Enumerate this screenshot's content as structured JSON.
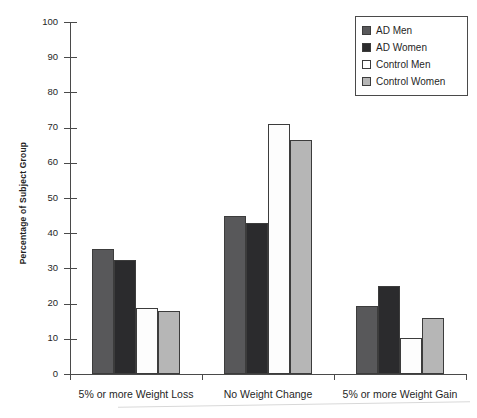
{
  "chart_data": {
    "type": "bar",
    "title": "",
    "xlabel": "",
    "ylabel": "Percentage of Subject Group",
    "ylim": [
      0,
      100
    ],
    "ytick_step": 10,
    "yticks": [
      0,
      10,
      20,
      30,
      40,
      50,
      60,
      70,
      80,
      90,
      100
    ],
    "grid": false,
    "legend_position": "top-right",
    "categories": [
      "5% or more Weight Loss",
      "No Weight Change",
      "5% or more Weight Gain"
    ],
    "series": [
      {
        "name": "AD Men",
        "color": "#58585a",
        "values": [
          35.5,
          45.0,
          19.3
        ]
      },
      {
        "name": "AD Women",
        "color": "#2b2b2d",
        "values": [
          32.5,
          43.0,
          25.0
        ]
      },
      {
        "name": "Control Men",
        "color": "#ffffff",
        "values": [
          18.8,
          71.0,
          10.3
        ]
      },
      {
        "name": "Control Women",
        "color": "#b6b6b6",
        "values": [
          18.0,
          66.5,
          16.0
        ]
      }
    ]
  },
  "legend": {
    "items": [
      {
        "label": "AD Men"
      },
      {
        "label": "AD Women"
      },
      {
        "label": "Control Men"
      },
      {
        "label": "Control Women"
      }
    ]
  },
  "axis": {
    "y_title": "Percentage of Subject Group"
  }
}
